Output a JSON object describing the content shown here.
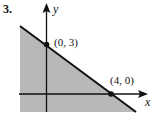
{
  "problem_number": "3.",
  "axes": {
    "x_label": "x",
    "y_label": "y"
  },
  "points": [
    {
      "label": "(0, 3)",
      "x": 0,
      "y": 3
    },
    {
      "label": "(4, 0)",
      "x": 4,
      "y": 0
    }
  ],
  "boundary_line": "from (0,3) to (4,0), solid",
  "shaded_region": "below and left of the line",
  "colors": {
    "shade": "#b8b8b8",
    "line": "#111111"
  }
}
